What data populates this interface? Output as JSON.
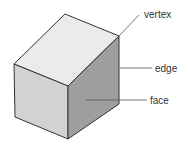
{
  "diagram": {
    "labels": {
      "vertex": "vertex",
      "edge": "edge",
      "face": "face"
    },
    "colors": {
      "top_face": "#ebebeb",
      "left_face": "#d2d2d2",
      "right_face": "#9e9e9e",
      "outline": "#333333",
      "leader": "#555555"
    }
  }
}
